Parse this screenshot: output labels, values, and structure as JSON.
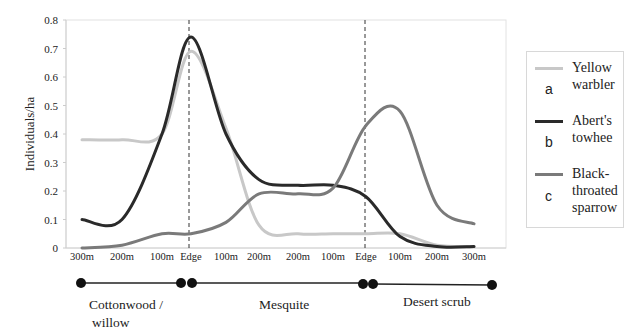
{
  "chart_data": {
    "type": "line",
    "title": "",
    "xlabel": "",
    "ylabel": "Individuals/ha",
    "ylim": [
      0,
      0.8
    ],
    "yticks": [
      "0",
      "0.1",
      "0.2",
      "0.3",
      "0.4",
      "0.5",
      "0.6",
      "0.7",
      "0.8"
    ],
    "grid": false,
    "legend_position": "right",
    "categories": [
      "300m",
      "200m",
      "100m",
      "Edge",
      "100m",
      "200m",
      "200m",
      "100m",
      "Edge",
      "100m",
      "200m",
      "300m"
    ],
    "edge_markers": [
      "Edge",
      "Edge"
    ],
    "series": [
      {
        "name": "Yellow warbler",
        "letter": "a",
        "color": "#c8c8c8",
        "values": [
          0.38,
          0.38,
          0.4,
          0.69,
          0.42,
          0.08,
          0.05,
          0.05,
          0.05,
          0.05,
          0.01,
          0.005
        ]
      },
      {
        "name": "Abert's towhee",
        "letter": "b",
        "color": "#2a2a2a",
        "values": [
          0.1,
          0.1,
          0.4,
          0.74,
          0.4,
          0.24,
          0.22,
          0.22,
          0.18,
          0.04,
          0.005,
          0.005
        ]
      },
      {
        "name": "Black-throated sparrow",
        "letter": "c",
        "color": "#7a7a7a",
        "values": [
          0.0,
          0.01,
          0.05,
          0.05,
          0.09,
          0.19,
          0.19,
          0.21,
          0.43,
          0.48,
          0.15,
          0.085
        ]
      }
    ],
    "habitats": [
      {
        "name": "Cottonwood / willow",
        "range": [
          "300m",
          "Edge"
        ]
      },
      {
        "name": "Mesquite",
        "range": [
          "Edge",
          "Edge"
        ]
      },
      {
        "name": "Desert scrub",
        "range": [
          "Edge",
          "300m"
        ]
      }
    ]
  },
  "legend": {
    "items": [
      {
        "letter": "a",
        "line1": "Yellow",
        "line2": "warbler",
        "line3": ""
      },
      {
        "letter": "b",
        "line1": "Abert's",
        "line2": "towhee",
        "line3": ""
      },
      {
        "letter": "c",
        "line1": "Black-",
        "line2": "throated",
        "line3": "sparrow"
      }
    ]
  },
  "habitat_bar": {
    "labels": {
      "cottonwood_line1": "Cottonwood /",
      "cottonwood_line2": "willow",
      "mesquite": "Mesquite",
      "desert": "Desert scrub"
    }
  }
}
